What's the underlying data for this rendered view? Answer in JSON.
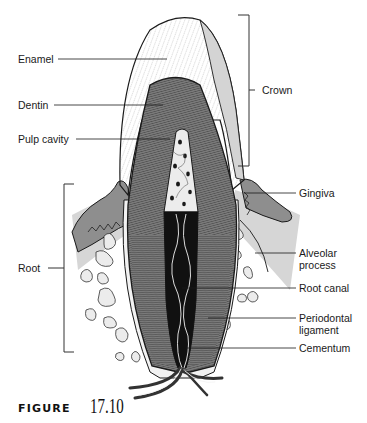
{
  "figure": {
    "word": "FIGURE",
    "number": "17.10"
  },
  "labels": {
    "enamel": "Enamel",
    "dentin": "Dentin",
    "pulp_cavity": "Pulp cavity",
    "crown": "Crown",
    "gingiva": "Gingiva",
    "root": "Root",
    "alveolar_process_line1": "Alveolar",
    "alveolar_process_line2": "process",
    "root_canal": "Root canal",
    "periodontal_ligament_line1": "Periodontal",
    "periodontal_ligament_line2": "ligament",
    "cementum": "Cementum"
  },
  "colors": {
    "line": "#1a1a1a",
    "dentin": "#6e6e6e",
    "gingiva": "#8c8c8c",
    "gum_light": "#d4d4d4",
    "bone_fill": "#ececec",
    "pulp_fill": "#e8e8e8",
    "canal": "#111111"
  }
}
